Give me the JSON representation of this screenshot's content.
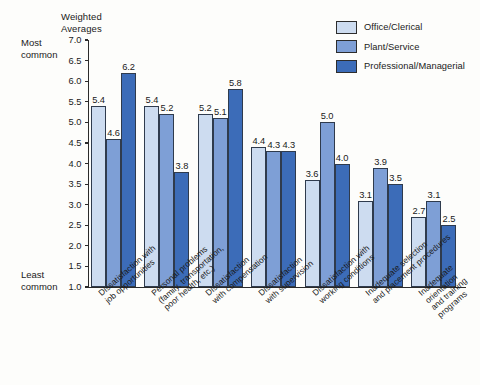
{
  "chart_data": {
    "type": "bar",
    "title": "",
    "ylabel": "Weighted\nAverages",
    "xlabel": "",
    "ylim": [
      1.0,
      7.0
    ],
    "ytick_labels": [
      "7.0",
      "6.5",
      "6.0",
      "5.5",
      "5.0",
      "4.5",
      "4.0",
      "3.5",
      "3.0",
      "2.5",
      "2.0",
      "1.5",
      "1.0"
    ],
    "ytick_values": [
      7.0,
      6.5,
      6.0,
      5.5,
      5.0,
      4.5,
      4.0,
      3.5,
      3.0,
      2.5,
      2.0,
      1.5,
      1.0
    ],
    "grid": false,
    "legend_position": "top-right",
    "scale_high_label": "Most\ncommon",
    "scale_low_label": "Least\ncommon",
    "categories": [
      "Dissatisfaction with\njob opportunities",
      "Personal problems\n(family, transportation,\npoor health, etc.)",
      "Dissatisfaction\nwith compensation",
      "Dissatisfaction\nwith supervision",
      "Dissatisfaction with\nworking conditions",
      "Inadequate selection\nand placement procedures",
      "Inadequate orientation\nand training programs"
    ],
    "series": [
      {
        "name": "Office/Clerical",
        "color": "#cddcf0",
        "values": [
          5.4,
          5.4,
          5.2,
          4.4,
          3.6,
          3.1,
          2.7
        ]
      },
      {
        "name": "Plant/Service",
        "color": "#7e9fd6",
        "values": [
          4.6,
          5.2,
          5.1,
          4.3,
          5.0,
          3.9,
          3.1
        ]
      },
      {
        "name": "Professional/Managerial",
        "color": "#3c6cb8",
        "values": [
          6.2,
          3.8,
          5.8,
          4.3,
          4.0,
          3.5,
          2.5
        ]
      }
    ]
  }
}
